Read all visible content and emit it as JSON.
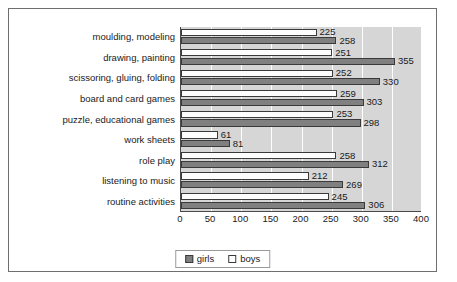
{
  "chart_data": {
    "type": "bar",
    "orientation": "horizontal",
    "title": "",
    "xlabel": "",
    "ylabel": "",
    "xlim": [
      0,
      400
    ],
    "xticks": [
      0,
      50,
      100,
      150,
      200,
      250,
      300,
      350,
      400
    ],
    "grid": true,
    "legend_position": "bottom-center",
    "categories": [
      "moulding, modeling",
      "drawing, painting",
      "scissoring, gluing, folding",
      "board and card games",
      "puzzle, educational games",
      "work sheets",
      "role play",
      "listening to music",
      "routine activities"
    ],
    "series": [
      {
        "name": "girls",
        "color": "#808080",
        "values": [
          258,
          355,
          330,
          303,
          298,
          81,
          312,
          269,
          306
        ]
      },
      {
        "name": "boys",
        "color": "#ffffff",
        "values": [
          225,
          251,
          252,
          259,
          253,
          61,
          258,
          212,
          245
        ]
      }
    ]
  },
  "legend": {
    "items": [
      {
        "label": "girls"
      },
      {
        "label": "boys"
      }
    ]
  },
  "colors": {
    "girls_fill": "#808080",
    "boys_fill": "#ffffff",
    "bar_outline": "#3a3a3a",
    "plot_background": "#d6d6d6",
    "gridline": "#ffffff",
    "frame_border": "#6e6e6e",
    "text": "#1a1a1a"
  }
}
